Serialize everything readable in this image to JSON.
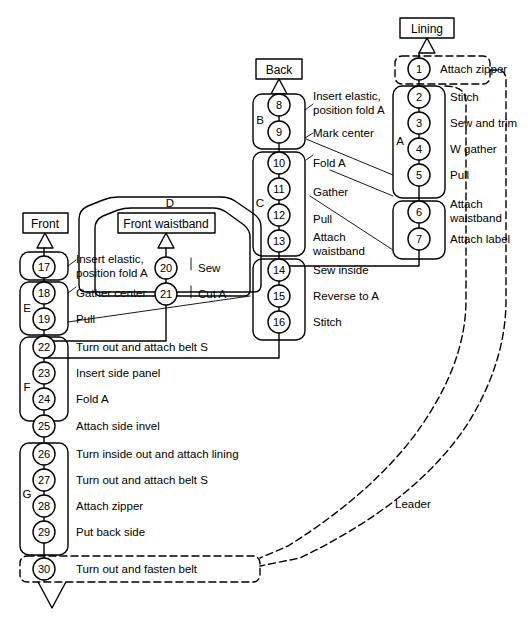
{
  "diagram": {
    "type": "assembly-flow",
    "stroke_color": "#000000",
    "background_color": "#ffffff"
  },
  "source_boxes": [
    {
      "id": "lining",
      "label": "Lining"
    },
    {
      "id": "back",
      "label": "Back"
    },
    {
      "id": "front",
      "label": "Front"
    },
    {
      "id": "front-waistband",
      "label": "Front waistband"
    }
  ],
  "group_labels": [
    {
      "id": "group-a",
      "label": "A"
    },
    {
      "id": "group-b",
      "label": "B"
    },
    {
      "id": "group-c",
      "label": "C"
    },
    {
      "id": "group-d",
      "label": "D"
    },
    {
      "id": "group-e",
      "label": "E"
    },
    {
      "id": "group-f",
      "label": "F"
    },
    {
      "id": "group-g",
      "label": "G"
    }
  ],
  "annotations": [
    {
      "id": "leader-label",
      "label": "Leader"
    }
  ],
  "nodes": [
    {
      "num": "1",
      "task": "Attach zipper",
      "group": "",
      "dashed": true
    },
    {
      "num": "2",
      "task": "Stitch",
      "group": "A",
      "dashed": false
    },
    {
      "num": "3",
      "task": "Sew and trim",
      "group": "A",
      "dashed": false
    },
    {
      "num": "4",
      "task": "W gather",
      "group": "A",
      "dashed": false
    },
    {
      "num": "5",
      "task": "Pull",
      "group": "A",
      "dashed": false
    },
    {
      "num": "6",
      "task": "Attach waistband",
      "group": "",
      "dashed": false
    },
    {
      "num": "7",
      "task": "Attach label",
      "group": "",
      "dashed": false
    },
    {
      "num": "8",
      "task": "Insert elastic, position fold A",
      "group": "B",
      "dashed": false
    },
    {
      "num": "9",
      "task": "Mark center",
      "group": "B",
      "dashed": false
    },
    {
      "num": "10",
      "task": "Fold A",
      "group": "C",
      "dashed": false
    },
    {
      "num": "11",
      "task": "Gather",
      "group": "C",
      "dashed": false
    },
    {
      "num": "12",
      "task": "Pull",
      "group": "C",
      "dashed": false
    },
    {
      "num": "13",
      "task": "Attach waistband",
      "group": "C",
      "dashed": false
    },
    {
      "num": "14",
      "task": "Sew inside",
      "group": "",
      "dashed": false
    },
    {
      "num": "15",
      "task": "Reverse to A",
      "group": "",
      "dashed": false
    },
    {
      "num": "16",
      "task": "Stitch",
      "group": "",
      "dashed": false
    },
    {
      "num": "17",
      "task": "Insert elastic, position fold A",
      "group": "",
      "dashed": false
    },
    {
      "num": "18",
      "task": "Gather center",
      "group": "E",
      "dashed": false
    },
    {
      "num": "19",
      "task": "Pull",
      "group": "E",
      "dashed": false
    },
    {
      "num": "20",
      "task": "Sew",
      "group": "D",
      "dashed": false
    },
    {
      "num": "21",
      "task": "Cut A",
      "group": "D",
      "dashed": false
    },
    {
      "num": "22",
      "task": "Turn out and attach belt S",
      "group": "F",
      "dashed": false
    },
    {
      "num": "23",
      "task": "Insert side panel",
      "group": "F",
      "dashed": false
    },
    {
      "num": "24",
      "task": "Fold A",
      "group": "F",
      "dashed": false
    },
    {
      "num": "25",
      "task": "Attach side invel",
      "group": "F",
      "dashed": false
    },
    {
      "num": "26",
      "task": "Turn inside out and attach lining",
      "group": "G",
      "dashed": false
    },
    {
      "num": "27",
      "task": "Turn out and attach belt S",
      "group": "G",
      "dashed": false
    },
    {
      "num": "28",
      "task": "Attach zipper",
      "group": "G",
      "dashed": false
    },
    {
      "num": "29",
      "task": "Put back side",
      "group": "G",
      "dashed": false
    },
    {
      "num": "30",
      "task": "Turn out and fasten belt",
      "group": "",
      "dashed": true
    }
  ],
  "labels": {
    "n1": "Attach zipper",
    "n2": "Stitch",
    "n3": "Sew and trim",
    "n4": "W gather",
    "n5": "Pull",
    "n6a": "Attach",
    "n6b": "waistband",
    "n7": "Attach label",
    "n8a": "Insert elastic,",
    "n8b": "position fold A",
    "n9": "Mark center",
    "n10": "Fold A",
    "n11": "Gather",
    "n12": "Pull",
    "n13a": "Attach",
    "n13b": "waistband",
    "n14": "Sew inside",
    "n15": "Reverse to A",
    "n16": "Stitch",
    "n17a": "Insert elastic,",
    "n17b": "position fold A",
    "n18": "Gather center",
    "n19": "Pull",
    "n20": "Sew",
    "n21": "Cut A",
    "n22": "Turn out and attach belt S",
    "n23": "Insert side panel",
    "n24": "Fold A",
    "n25": "Attach side invel",
    "n26": "Turn inside out and attach lining",
    "n27": "Turn out and attach belt S",
    "n28": "Attach zipper",
    "n29": "Put back side",
    "n30": "Turn out and fasten belt",
    "num1": "1",
    "num2": "2",
    "num3": "3",
    "num4": "4",
    "num5": "5",
    "num6": "6",
    "num7": "7",
    "num8": "8",
    "num9": "9",
    "num10": "10",
    "num11": "11",
    "num12": "12",
    "num13": "13",
    "num14": "14",
    "num15": "15",
    "num16": "16",
    "num17": "17",
    "num18": "18",
    "num19": "19",
    "num20": "20",
    "num21": "21",
    "num22": "22",
    "num23": "23",
    "num24": "24",
    "num25": "25",
    "num26": "26",
    "num27": "27",
    "num28": "28",
    "num29": "29",
    "num30": "30",
    "grpA": "A",
    "grpB": "B",
    "grpC": "C",
    "grpD": "D",
    "grpE": "E",
    "grpF": "F",
    "grpG": "G",
    "boxLining": "Lining",
    "boxBack": "Back",
    "boxFront": "Front",
    "boxFrontWaistband": "Front waistband",
    "leader": "Leader"
  }
}
